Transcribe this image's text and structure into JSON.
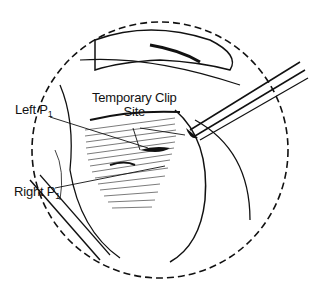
{
  "figure": {
    "type": "surgical-illustration",
    "labels": {
      "temporary_clip_line1": "Temporary Clip",
      "temporary_clip_line2": "Site",
      "left_p1_main": "Left P",
      "left_p1_sub": "1",
      "right_p1_main": "Right P",
      "right_p1_sub": "1"
    },
    "colors": {
      "ink": "#111111",
      "background": "#ffffff"
    }
  }
}
